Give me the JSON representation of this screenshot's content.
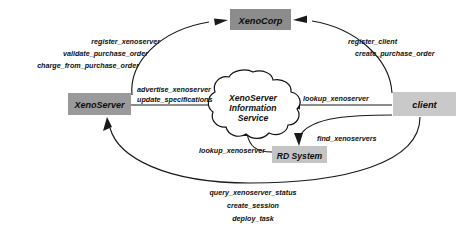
{
  "diagram": {
    "background": "#ffffff",
    "line_color": "#1a1a1a",
    "nodes": {
      "xenocorp": {
        "label": "XenoCorp",
        "fill": "#8c8c8c",
        "x": 230,
        "y": 9,
        "width": 61,
        "height": 21
      },
      "xenoserver": {
        "label": "XenoServer",
        "fill": "#9a9a9a",
        "x": 68,
        "y": 93,
        "width": 63,
        "height": 22
      },
      "client": {
        "label": "client",
        "fill": "#c9c9c9",
        "x": 393,
        "y": 92,
        "width": 63,
        "height": 24
      },
      "rd_system": {
        "label": "RD System",
        "fill": "#c4c4c4",
        "x": 272,
        "y": 146,
        "width": 55,
        "height": 17
      },
      "information_service": {
        "label_lines": [
          "XenoServer",
          "Information",
          "Service"
        ],
        "fill": "#ffffff",
        "cx": 253,
        "cy": 105
      }
    },
    "edge_label_groups": {
      "xenoserver_to_xenocorp": {
        "align": "right",
        "lines": [
          "register_xenoserver",
          "validate_purchase_order",
          "charge_from_purchase_order"
        ]
      },
      "client_to_xenocorp": {
        "align": "left",
        "lines": [
          "register_client",
          "create_purchase_order"
        ]
      },
      "xenoserver_to_service": {
        "align": "left",
        "lines": [
          "advertise_xenoserver",
          "update_specifications"
        ]
      },
      "client_to_service": {
        "align": "left",
        "lines": [
          "lookup_xenoserver"
        ]
      },
      "client_to_rd_system": {
        "align": "left",
        "lines": [
          "find_xenoservers"
        ]
      },
      "rd_system_to_service": {
        "align": "right",
        "lines": [
          "lookup_xenoserver"
        ]
      },
      "client_to_xenoserver": {
        "align": "center",
        "lines": [
          "query_xenoserver_status",
          "create_session",
          "deploy_task"
        ]
      }
    }
  }
}
